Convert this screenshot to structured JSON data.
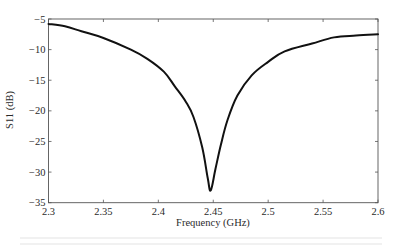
{
  "chart_data": {
    "type": "line",
    "title": "",
    "xlabel": "Frequency (GHz)",
    "ylabel": "S11 (dB)",
    "xlim": [
      2.3,
      2.6
    ],
    "ylim": [
      -35,
      -5
    ],
    "xticks": [
      2.3,
      2.35,
      2.4,
      2.45,
      2.5,
      2.55,
      2.6
    ],
    "xtick_labels": [
      "2.3",
      "2.35",
      "2.4",
      "2.45",
      "2.5",
      "2.55",
      "2.6"
    ],
    "yticks": [
      -5,
      -10,
      -15,
      -20,
      -25,
      -30,
      -35
    ],
    "ytick_labels": [
      "-5",
      "-10",
      "-15",
      "-20",
      "-25",
      "-30",
      "-35"
    ],
    "grid": false,
    "legend": null,
    "series": [
      {
        "name": "S11",
        "color": "#111111",
        "x": [
          2.3,
          2.315,
          2.33,
          2.35,
          2.375,
          2.39,
          2.405,
          2.415,
          2.425,
          2.432,
          2.44,
          2.445,
          2.4477,
          2.452,
          2.457,
          2.463,
          2.472,
          2.485,
          2.5,
          2.515,
          2.54,
          2.56,
          2.58,
          2.6
        ],
        "y": [
          -5.8,
          -6.2,
          -7.0,
          -8.1,
          -10.0,
          -11.5,
          -13.6,
          -16.0,
          -18.5,
          -21.0,
          -26.0,
          -31.0,
          -33.0,
          -29.5,
          -25.5,
          -21.5,
          -17.5,
          -14.2,
          -12.0,
          -10.3,
          -9.0,
          -8.0,
          -7.7,
          -7.5
        ]
      }
    ],
    "annotations": [
      {
        "text": "minimum ≈ -33 dB near 2.447 GHz",
        "visible": false
      }
    ]
  },
  "layout": {
    "plot": {
      "left": 48.5,
      "top": 19,
      "right": 378,
      "bottom": 202.7
    }
  }
}
